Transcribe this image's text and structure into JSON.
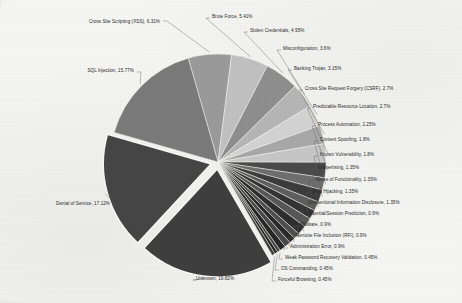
{
  "chart_data": {
    "type": "pie",
    "title": "",
    "subtitle": "",
    "xlabel": "",
    "ylabel": "",
    "legend_position": "none",
    "labels_position": "outside-with-leader-lines",
    "grid": false,
    "units": "percent",
    "exploded_slices": [
      "Denial of Service",
      "Unknown"
    ],
    "categories": [
      "Cross Site Scripting (XSS)",
      "Brute Force",
      "Stolen Credentials",
      "Misconfiguration",
      "Banking Trojan",
      "Cross Site Request Forgery (CSRF)",
      "Predictable Resource Location",
      "Process Automation",
      "Content Spoofing",
      "Known Vulnerability",
      "Malvertising",
      "Abuse of Functionality",
      "DNS Hijacking",
      "Unintentional Information Disclosure",
      "Credential/Session Prediction",
      "Malware",
      "Remote File Inclusion (RFI)",
      "Administration Error",
      "Weak Password Recovery Validation",
      "OS Commanding",
      "Forceful Browsing",
      "Unknown",
      "Denial of Service",
      "SQL Injection"
    ],
    "values": [
      6.31,
      5.41,
      4.95,
      3.6,
      3.15,
      2.7,
      2.7,
      2.25,
      1.8,
      1.8,
      1.35,
      1.35,
      1.35,
      1.35,
      0.9,
      0.9,
      0.9,
      0.9,
      0.45,
      0.45,
      0.45,
      19.82,
      17.12,
      15.77
    ],
    "slices": [
      {
        "label": "Cross Site Scripting (XSS)",
        "value": 6.31,
        "text": "Cross Site Scripting (XSS), 6.31%",
        "color": "#9a9a9a"
      },
      {
        "label": "Brute Force",
        "value": 5.41,
        "text": "Brute Force, 5.41%",
        "color": "#c0c0c0"
      },
      {
        "label": "Stolen Credentials",
        "value": 4.95,
        "text": "Stolen Credentials, 4.95%",
        "color": "#8e8e8e"
      },
      {
        "label": "Misconfiguration",
        "value": 3.6,
        "text": "Misconfiguration, 3.6%",
        "color": "#b5b5b5"
      },
      {
        "label": "Banking Trojan",
        "value": 3.15,
        "text": "Banking Trojan, 3.15%",
        "color": "#d2d2d2"
      },
      {
        "label": "Cross Site Request Forgery (CSRF)",
        "value": 2.7,
        "text": "Cross Site Request Forgery (CSRF), 2.7%",
        "color": "#a8a8a8"
      },
      {
        "label": "Predictable Resource Location",
        "value": 2.7,
        "text": "Predictable Resource Location, 2.7%",
        "color": "#c6c6c6"
      },
      {
        "label": "Process Automation",
        "value": 2.25,
        "text": "Process Automation, 2.25%",
        "color": "#4a4a4a"
      },
      {
        "label": "Content Spoofing",
        "value": 1.8,
        "text": "Content Spoofing, 1.8%",
        "color": "#6e6e6e"
      },
      {
        "label": "Known Vulnerability",
        "value": 1.8,
        "text": "Known Vulnerability, 1.8%",
        "color": "#3c3c3c"
      },
      {
        "label": "Malvertising",
        "value": 1.35,
        "text": "Malvertising, 1.35%",
        "color": "#5e5e5e"
      },
      {
        "label": "Abuse of Functionality",
        "value": 1.35,
        "text": "Abuse of Functionality, 1.35%",
        "color": "#343434"
      },
      {
        "label": "DNS Hijacking",
        "value": 1.35,
        "text": "DNS Hijacking, 1.35%",
        "color": "#575757"
      },
      {
        "label": "Unintentional Information Disclosure",
        "value": 1.35,
        "text": "Unintentional Information Disclosure, 1.35%",
        "color": "#2e2e2e"
      },
      {
        "label": "Credential/Session Prediction",
        "value": 0.9,
        "text": "Credential/Session Prediction, 0.9%",
        "color": "#4e4e4e"
      },
      {
        "label": "Malware",
        "value": 0.9,
        "text": "Malware, 0.9%",
        "color": "#2a2a2a"
      },
      {
        "label": "Remote File Inclusion (RFI)",
        "value": 0.9,
        "text": "Remote File Inclusion (RFI), 0.9%",
        "color": "#484848"
      },
      {
        "label": "Administration Error",
        "value": 0.9,
        "text": "Administration Error, 0.9%",
        "color": "#262626"
      },
      {
        "label": "Weak Password Recovery Validation",
        "value": 0.45,
        "text": "Weak Password Recovery Validation, 0.45%",
        "color": "#444444"
      },
      {
        "label": "OS Commanding",
        "value": 0.45,
        "text": "OS Commanding, 0.45%",
        "color": "#222222"
      },
      {
        "label": "Forceful Browsing",
        "value": 0.45,
        "text": "Forceful Browsing, 0.45%",
        "color": "#3a3a3a"
      },
      {
        "label": "Unknown",
        "value": 19.82,
        "text": "Unknown, 19.82%",
        "color": "#3f3f3f"
      },
      {
        "label": "Denial of Service",
        "value": 17.12,
        "text": "Denial of Service, 17.12%",
        "color": "#454545"
      },
      {
        "label": "SQL Injection",
        "value": 15.77,
        "text": "SQL Injection, 15.77%",
        "color": "#7a7a7a"
      }
    ]
  },
  "labels": {
    "cross_site_scripting": "Cross Site Scripting (XSS), 6.31%",
    "brute_force": "Brute Force, 5.41%",
    "stolen_credentials": "Stolen Credentials, 4.95%",
    "misconfiguration": "Misconfiguration, 3.6%",
    "banking_trojan": "Banking Trojan, 3.15%",
    "csrf": "Cross Site Request Forgery (CSRF), 2.7%",
    "predictable_resource_location": "Predictable Resource Location, 2.7%",
    "process_automation": "Process Automation, 2.25%",
    "content_spoofing": "Content Spoofing, 1.8%",
    "known_vulnerability": "Known Vulnerability, 1.8%",
    "malvertising": "Malvertising, 1.35%",
    "abuse_of_functionality": "Abuse of Functionality, 1.35%",
    "dns_hijacking": "DNS Hijacking, 1.35%",
    "unintentional_information_disclosure": "Unintentional Information Disclosure, 1.35%",
    "credential_session_prediction": "Credential/Session Prediction, 0.9%",
    "malware": "Malware, 0.9%",
    "remote_file_inclusion": "Remote File Inclusion (RFI), 0.9%",
    "administration_error": "Administration Error, 0.9%",
    "weak_password_recovery": "Weak Password Recovery Validation, 0.45%",
    "os_commanding": "OS Commanding, 0.45%",
    "forceful_browsing": "Forceful Browsing, 0.45%",
    "unknown": "Unknown, 19.82%",
    "denial_of_service": "Denial of Service, 17.12%",
    "sql_injection": "SQL Injection, 15.77%"
  }
}
